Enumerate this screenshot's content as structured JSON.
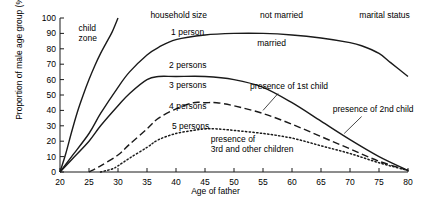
{
  "chart_data": {
    "type": "line",
    "title": "",
    "xlabel": "Age of father",
    "ylabel": "Proportion of male age group (%)",
    "xlim": [
      20,
      80
    ],
    "ylim": [
      0,
      100
    ],
    "xticks": [
      20,
      25,
      30,
      35,
      40,
      45,
      50,
      55,
      60,
      65,
      70,
      75,
      80
    ],
    "yticks": [
      0,
      10,
      20,
      30,
      40,
      50,
      60,
      70,
      80,
      90,
      100
    ],
    "grid": false,
    "legend_position": "inline-annotations",
    "series": [
      {
        "name": "not married",
        "style": "solid",
        "x": [
          20,
          21,
          22,
          23,
          24,
          25,
          26,
          27,
          28,
          29,
          30
        ],
        "y": [
          0,
          12,
          26,
          39,
          50,
          60,
          69,
          77,
          84,
          91,
          100
        ]
      },
      {
        "name": "married",
        "style": "solid",
        "x": [
          20,
          22,
          25,
          27,
          30,
          32,
          35,
          37,
          40,
          45,
          50,
          55,
          60,
          65,
          70,
          72,
          75,
          77,
          80
        ],
        "y": [
          0,
          10,
          25,
          38,
          55,
          65,
          76,
          81,
          86,
          89,
          90,
          90,
          89,
          87,
          84,
          82,
          77,
          71,
          62
        ]
      },
      {
        "name": "1 person",
        "style": "solid",
        "x": [
          20,
          22,
          25,
          27,
          30,
          32,
          35,
          37,
          40,
          45,
          50,
          55,
          60,
          65,
          70,
          75,
          80
        ],
        "y": [
          0,
          8,
          20,
          30,
          43,
          51,
          60,
          62,
          62,
          62,
          60,
          55,
          45,
          33,
          21,
          10,
          1
        ]
      },
      {
        "name": "2 persons",
        "style": "dashed",
        "x": [
          25,
          27,
          30,
          32,
          35,
          37,
          40,
          43,
          45,
          47,
          50,
          55,
          60,
          65,
          70,
          75,
          80
        ],
        "y": [
          0,
          4,
          11,
          18,
          28,
          35,
          41,
          45,
          45,
          45,
          43,
          38,
          31,
          23,
          15,
          7,
          1
        ]
      },
      {
        "name": "3 persons",
        "style": "dotted",
        "x": [
          27,
          29,
          30,
          32,
          35,
          37,
          40,
          43,
          45,
          47,
          50,
          55,
          60,
          65,
          70,
          75,
          80
        ],
        "y": [
          0,
          2,
          4,
          9,
          16,
          21,
          25,
          27,
          28,
          28,
          27,
          25,
          22,
          17,
          12,
          6,
          1
        ]
      }
    ],
    "annotations": [
      {
        "text": "child zone",
        "x": 24.5,
        "y": 92
      },
      {
        "text": "household size",
        "x": 40.5,
        "y": 101
      },
      {
        "text": "not married",
        "x": 58.5,
        "y": 101
      },
      {
        "text": "marital status",
        "x": 76.0,
        "y": 101
      },
      {
        "text": "1 person",
        "x": 42.0,
        "y": 90
      },
      {
        "text": "married",
        "x": 57.0,
        "y": 83
      },
      {
        "text": "2 persons",
        "x": 41.5,
        "y": 69
      },
      {
        "text": "3 persons",
        "x": 41.5,
        "y": 56
      },
      {
        "text": "4 persons",
        "x": 41.5,
        "y": 42
      },
      {
        "text": "5 persons",
        "x": 41.5,
        "y": 29
      },
      {
        "text": "presence of 1st child",
        "x": 59.0,
        "y": 55
      },
      {
        "text": "presence of 2nd child",
        "x": 74.5,
        "y": 40
      },
      {
        "text": "presence of 3rd and other children",
        "x": 52.0,
        "y": 22
      }
    ]
  },
  "axis": {
    "ylabel": "Proportion of male age group (%)",
    "xlabel": "Age of father",
    "xticklabels": [
      "20",
      "25",
      "30",
      "35",
      "40",
      "45",
      "50",
      "55",
      "60",
      "65",
      "70",
      "75",
      "80"
    ],
    "yticklabels": [
      "0",
      "10",
      "20",
      "30",
      "40",
      "50",
      "60",
      "70",
      "80",
      "90",
      "100"
    ]
  },
  "labels": {
    "child_zone_line1": "child",
    "child_zone_line2": "zone",
    "household_size": "household size",
    "not_married": "not married",
    "marital_status": "marital status",
    "one_person": "1 person",
    "married": "married",
    "two_persons": "2 persons",
    "three_persons": "3 persons",
    "four_persons": "4 persons",
    "five_persons": "5 persons",
    "presence_1st_child": "presence of 1st child",
    "presence_2nd_child": "presence of 2nd child",
    "presence_3rd_line1": "presence of",
    "presence_3rd_line2": "3rd and other children"
  },
  "colors": {
    "ink": "#1a1a1a",
    "background": "#ffffff"
  }
}
